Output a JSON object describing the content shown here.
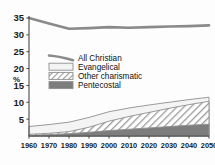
{
  "chart_data": {
    "type": "area",
    "title": "",
    "subtitle": "",
    "xlabel": "",
    "ylabel": "%",
    "x": [
      1960,
      1970,
      1980,
      1990,
      2000,
      2010,
      2020,
      2030,
      2040,
      2050
    ],
    "xtick_labels": [
      "1960",
      "1970",
      "1980",
      "1990",
      "2000",
      "2010",
      "2020",
      "2030",
      "2040",
      "2050"
    ],
    "ytick_labels": [
      "5",
      "10",
      "15",
      "20",
      "25",
      "30",
      "35"
    ],
    "ytick_values": [
      5,
      10,
      15,
      20,
      25,
      30,
      35
    ],
    "xlim": [
      1960,
      2050
    ],
    "ylim": [
      0,
      35
    ],
    "grid": false,
    "legend_position": "center-left",
    "stacked": true,
    "series": [
      {
        "name": "All Christian",
        "kind": "line",
        "stacked": false,
        "style": "thick-gray-line",
        "color": "#8a8a8a",
        "values": [
          35.0,
          33.4,
          31.8,
          32.0,
          32.3,
          32.1,
          32.3,
          32.5,
          32.6,
          32.8
        ]
      },
      {
        "name": "Evangelical",
        "kind": "area",
        "stacked": true,
        "style": "light-band",
        "color": "#f2f2f2",
        "values": [
          2.8,
          3.4,
          4.1,
          5.5,
          7.2,
          8.3,
          9.2,
          10.0,
          10.8,
          11.5
        ]
      },
      {
        "name": "Other charismatic",
        "kind": "area",
        "stacked": true,
        "style": "diagonal-hatch",
        "color": "#b8b8b8",
        "values": [
          0.5,
          0.8,
          1.3,
          2.6,
          4.4,
          5.8,
          7.0,
          8.2,
          9.3,
          10.3
        ]
      },
      {
        "name": "Pentecostal",
        "kind": "area",
        "stacked": true,
        "style": "solid-dark",
        "color": "#7d7d7d",
        "values": [
          0.2,
          0.4,
          0.7,
          1.1,
          1.6,
          2.0,
          2.4,
          2.8,
          3.2,
          3.5
        ]
      }
    ],
    "legend_entries": [
      {
        "label": "All Christian",
        "swatch": "thick-gray-line"
      },
      {
        "label": "Evangelical",
        "swatch": "light-band"
      },
      {
        "label": "Other charismatic",
        "swatch": "diagonal-hatch"
      },
      {
        "label": "Pentecostal",
        "swatch": "solid-dark"
      }
    ],
    "colors": {
      "line": "#8a8a8a",
      "evangelical": "#f2f2f2",
      "charismatic_hatch": "#a9a9a9",
      "pentecostal": "#7d7d7d",
      "axis": "#4a4a4a",
      "text": "#1a1a1a",
      "background": "#fdfdfd"
    }
  }
}
